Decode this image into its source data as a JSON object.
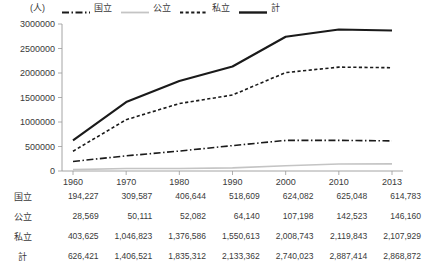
{
  "chart_data": {
    "type": "line",
    "title": "",
    "xlabel": "",
    "ylabel": "(人)",
    "unit_label": "(人)",
    "x": [
      "1960",
      "1970",
      "1980",
      "1990",
      "2000",
      "2010",
      "2013"
    ],
    "categories": [
      "1960",
      "1970",
      "1980",
      "1990",
      "2000",
      "2010",
      "2013"
    ],
    "ylim": [
      0,
      3000000
    ],
    "ytick_labels": [
      "0",
      "500000",
      "1000000",
      "1500000",
      "2000000",
      "2500000",
      "3000000"
    ],
    "ytick_values": [
      0,
      500000,
      1000000,
      1500000,
      2000000,
      2500000,
      3000000
    ],
    "grid": false,
    "legend_position": "top",
    "series": [
      {
        "name": "国立",
        "style": "dash-dot",
        "color": "#1a1a1a",
        "width": 1.6,
        "values": [
          194227,
          309587,
          406644,
          518609,
          624082,
          625048,
          614783
        ]
      },
      {
        "name": "公立",
        "style": "solid",
        "color": "#c4c4c4",
        "width": 1.6,
        "values": [
          28569,
          50111,
          52082,
          64140,
          107198,
          142523,
          146160
        ]
      },
      {
        "name": "私立",
        "style": "dotted",
        "color": "#1a1a1a",
        "width": 1.6,
        "values": [
          403625,
          1046823,
          1376586,
          1550613,
          2008743,
          2119843,
          2107929
        ]
      },
      {
        "name": "計",
        "style": "solid",
        "color": "#1a1a1a",
        "width": 2.1,
        "values": [
          626421,
          1406521,
          1835312,
          2133362,
          2740023,
          2887414,
          2868872
        ]
      }
    ]
  },
  "legend": {
    "items": [
      {
        "label": "国立",
        "icon": "dash-dot-line-icon"
      },
      {
        "label": "公立",
        "icon": "solid-gray-line-icon"
      },
      {
        "label": "私立",
        "icon": "dotted-line-icon"
      },
      {
        "label": "計",
        "icon": "solid-bold-line-icon"
      }
    ]
  },
  "table": {
    "column_headers": [
      "1960",
      "1970",
      "1980",
      "1990",
      "2000",
      "2010",
      "2013"
    ],
    "rows": [
      {
        "label": "国立",
        "values": [
          "194,227",
          "309,587",
          "406,644",
          "518,609",
          "624,082",
          "625,048",
          "614,783"
        ]
      },
      {
        "label": "公立",
        "values": [
          "28,569",
          "50,111",
          "52,082",
          "64,140",
          "107,198",
          "142,523",
          "146,160"
        ]
      },
      {
        "label": "私立",
        "values": [
          "403,625",
          "1,046,823",
          "1,376,586",
          "1,550,613",
          "2,008,743",
          "2,119,843",
          "2,107,929"
        ]
      },
      {
        "label": "計",
        "values": [
          "626,421",
          "1,406,521",
          "1,835,312",
          "2,133,362",
          "2,740,023",
          "2,887,414",
          "2,868,872"
        ]
      }
    ]
  },
  "colors": {
    "text": "#3a3a3a",
    "line_dark": "#1a1a1a",
    "line_gray": "#c4c4c4",
    "axis": "#9a9a9a"
  }
}
